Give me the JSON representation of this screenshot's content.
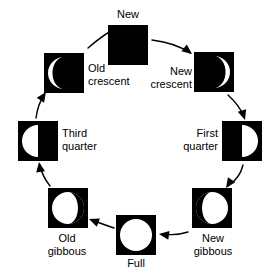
{
  "diagram": {
    "background_color": "#ffffff",
    "dark_color": "#000000",
    "light_color": "#ffffff",
    "phases": [
      {
        "id": "new",
        "label": "New",
        "illumination": "none",
        "lit_side": "none",
        "square": {
          "x": 108,
          "y": 25,
          "size": 40
        },
        "label_pos": {
          "x": 98,
          "y": 8,
          "width": 60
        },
        "label_align": "c"
      },
      {
        "id": "new-crescent",
        "label": "New\ncrescent",
        "illumination": "crescent",
        "lit_side": "right",
        "square": {
          "x": 194,
          "y": 52,
          "size": 40
        },
        "label_pos": {
          "x": 132,
          "y": 65,
          "width": 60
        },
        "label_align": "r"
      },
      {
        "id": "first-quarter",
        "label": "First\nquarter",
        "illumination": "half",
        "lit_side": "right",
        "square": {
          "x": 222,
          "y": 121,
          "size": 40
        },
        "label_pos": {
          "x": 160,
          "y": 127,
          "width": 58
        },
        "label_align": "r"
      },
      {
        "id": "new-gibbous",
        "label": "New\ngibbous",
        "illumination": "gibbous",
        "lit_side": "right",
        "square": {
          "x": 192,
          "y": 188,
          "size": 40
        },
        "label_pos": {
          "x": 182,
          "y": 232,
          "width": 62
        },
        "label_align": "c"
      },
      {
        "id": "full",
        "label": "Full",
        "illumination": "full",
        "lit_side": "both",
        "square": {
          "x": 116,
          "y": 215,
          "size": 40
        },
        "label_pos": {
          "x": 106,
          "y": 257,
          "width": 60
        },
        "label_align": "c"
      },
      {
        "id": "old-gibbous",
        "label": "Old\ngibbous",
        "illumination": "gibbous",
        "lit_side": "left",
        "square": {
          "x": 48,
          "y": 188,
          "size": 40
        },
        "label_pos": {
          "x": 36,
          "y": 232,
          "width": 62
        },
        "label_align": "c"
      },
      {
        "id": "third-quarter",
        "label": "Third\nquarter",
        "illumination": "half",
        "lit_side": "left",
        "square": {
          "x": 18,
          "y": 121,
          "size": 40
        },
        "label_pos": {
          "x": 62,
          "y": 127,
          "width": 58
        },
        "label_align": "l"
      },
      {
        "id": "old-crescent",
        "label": "Old\ncrescent",
        "illumination": "crescent",
        "lit_side": "left",
        "square": {
          "x": 44,
          "y": 53,
          "size": 40
        },
        "label_pos": {
          "x": 88,
          "y": 62,
          "width": 64
        },
        "label_align": "l"
      }
    ],
    "arrows": [
      {
        "id": "arrow-old-crescent-to-new",
        "from": "old-crescent",
        "to": "new",
        "path": "M 88 48 Q 104 34 118 27",
        "head": {
          "x": 120,
          "y": 26,
          "angle": -28
        }
      },
      {
        "id": "arrow-new-to-new-crescent",
        "from": "new",
        "to": "new-crescent",
        "path": "M 152 40 Q 176 43 190 53",
        "head": {
          "x": 192,
          "y": 54,
          "angle": 38
        }
      },
      {
        "id": "arrow-new-crescent-to-first-quarter",
        "from": "new-crescent",
        "to": "first-quarter",
        "path": "M 228 95 Q 240 106 244 117",
        "head": {
          "x": 245,
          "y": 120,
          "angle": 72
        }
      },
      {
        "id": "arrow-first-quarter-to-new-gibbous",
        "from": "first-quarter",
        "to": "new-gibbous",
        "path": "M 243 165 Q 240 178 228 186",
        "head": {
          "x": 226,
          "y": 188,
          "angle": 124
        }
      },
      {
        "id": "arrow-new-gibbous-to-full",
        "from": "new-gibbous",
        "to": "full",
        "path": "M 188 232 Q 176 236 162 234",
        "head": {
          "x": 159,
          "y": 234,
          "angle": 188
        }
      },
      {
        "id": "arrow-full-to-old-gibbous",
        "from": "full",
        "to": "old-gibbous",
        "path": "M 114 228 Q 102 224 92 220",
        "head": {
          "x": 89,
          "y": 219,
          "angle": 201
        }
      },
      {
        "id": "arrow-old-gibbous-to-third-quarter",
        "from": "old-gibbous",
        "to": "third-quarter",
        "path": "M 50 186 Q 42 176 40 165",
        "head": {
          "x": 39,
          "y": 162,
          "angle": 261
        }
      },
      {
        "id": "arrow-third-quarter-to-old-crescent",
        "from": "third-quarter",
        "to": "old-crescent",
        "path": "M 36 118 Q 38 104 44 95",
        "head": {
          "x": 46,
          "y": 92,
          "angle": 304
        }
      }
    ]
  }
}
